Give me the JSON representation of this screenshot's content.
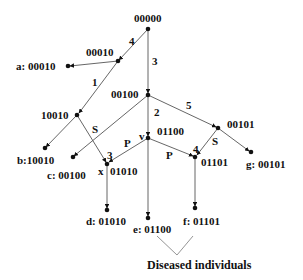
{
  "nodes": {
    "root": {
      "label": "00000"
    },
    "n00010": {
      "label": "00010"
    },
    "n10010": {
      "label": "10010"
    },
    "n00100": {
      "label": "00100"
    },
    "v": {
      "marker": "v",
      "label": "01100"
    },
    "n00101": {
      "label": "00101"
    },
    "x": {
      "marker": "x",
      "label": "01010"
    },
    "n01101": {
      "label": "01101"
    }
  },
  "leaves": {
    "a": {
      "label": "a: 00010"
    },
    "b": {
      "label": "b:10010"
    },
    "c": {
      "label": "c: 00100"
    },
    "d": {
      "label": "d: 01010"
    },
    "e": {
      "label": "e: 01100"
    },
    "f": {
      "label": "f: 01101"
    },
    "g": {
      "label": "g: 00101"
    }
  },
  "edge_labels": {
    "root_00010": "4",
    "root_00100": "3",
    "n00010_10010": "1",
    "n10010_x": "S",
    "n00100_v": "2",
    "n00100_00101": "5",
    "v_x_p": "P",
    "v_x_num": "3",
    "v_01101_p": "P",
    "n00101_01101_s": "S",
    "n00101_01101_num": "4"
  },
  "caption": "Diseased individuals",
  "colors": {
    "line": "#555555",
    "node": "#111111",
    "text": "#111111"
  }
}
